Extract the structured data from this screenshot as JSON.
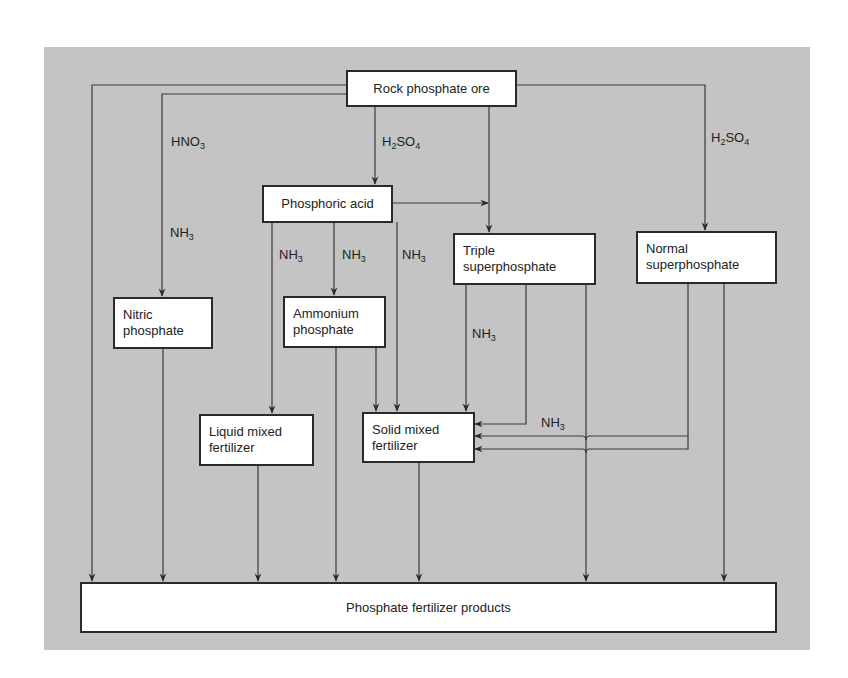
{
  "diagram": {
    "type": "flowchart",
    "colors": {
      "background": "#c4c4c4",
      "box_fill": "#ffffff",
      "line": "#2a2a2a"
    },
    "nodes": {
      "rock": {
        "line1": "Rock phosphate ore"
      },
      "phosphoric": {
        "line1": "Phosphoric acid"
      },
      "triple": {
        "line1": "Triple",
        "line2": "superphosphate"
      },
      "normal": {
        "line1": "Normal",
        "line2": "superphosphate"
      },
      "nitric": {
        "line1": "Nitric",
        "line2": "phosphate"
      },
      "ammonium": {
        "line1": "Ammonium",
        "line2": "phosphate"
      },
      "liquid": {
        "line1": "Liquid mixed",
        "line2": "fertilizer"
      },
      "solid": {
        "line1": "Solid mixed",
        "line2": "fertilizer"
      },
      "products": {
        "line1": "Phosphate fertilizer products"
      }
    },
    "edge_labels": {
      "hno3": {
        "base": "HNO",
        "sub": "3"
      },
      "h2so4_center": {
        "a": "H",
        "sub1": "2",
        "b": "SO",
        "sub2": "4"
      },
      "h2so4_right": {
        "a": "H",
        "sub1": "2",
        "b": "SO",
        "sub2": "4"
      },
      "nh3_nitric": {
        "base": "NH",
        "sub": "3"
      },
      "nh3_liquid": {
        "base": "NH",
        "sub": "3"
      },
      "nh3_ammonium": {
        "base": "NH",
        "sub": "3"
      },
      "nh3_solid": {
        "base": "NH",
        "sub": "3"
      },
      "nh3_triple": {
        "base": "NH",
        "sub": "3"
      },
      "nh3_normal": {
        "base": "NH",
        "sub": "3"
      }
    },
    "edges": [
      {
        "from": "Rock phosphate ore",
        "to": "Phosphate fertilizer products"
      },
      {
        "from": "Rock phosphate ore",
        "to": "Nitric phosphate",
        "reagents": [
          "HNO3",
          "NH3"
        ]
      },
      {
        "from": "Rock phosphate ore",
        "to": "Phosphoric acid",
        "reagent": "H2SO4"
      },
      {
        "from": "Rock phosphate ore",
        "to": "Triple superphosphate"
      },
      {
        "from": "Rock phosphate ore",
        "to": "Normal superphosphate",
        "reagent": "H2SO4"
      },
      {
        "from": "Phosphoric acid",
        "to": "Triple superphosphate"
      },
      {
        "from": "Phosphoric acid",
        "to": "Liquid mixed fertilizer",
        "reagent": "NH3"
      },
      {
        "from": "Phosphoric acid",
        "to": "Ammonium phosphate",
        "reagent": "NH3"
      },
      {
        "from": "Phosphoric acid",
        "to": "Solid mixed fertilizer",
        "reagent": "NH3"
      },
      {
        "from": "Nitric phosphate",
        "to": "Phosphate fertilizer products"
      },
      {
        "from": "Ammonium phosphate",
        "to": "Phosphate fertilizer products"
      },
      {
        "from": "Ammonium phosphate",
        "to": "Solid mixed fertilizer"
      },
      {
        "from": "Triple superphosphate",
        "to": "Solid mixed fertilizer",
        "reagent": "NH3"
      },
      {
        "from": "Triple superphosphate",
        "to": "Solid mixed fertilizer"
      },
      {
        "from": "Triple superphosphate",
        "to": "Phosphate fertilizer products"
      },
      {
        "from": "Normal superphosphate",
        "to": "Solid mixed fertilizer",
        "reagent": "NH3"
      },
      {
        "from": "Normal superphosphate",
        "to": "Solid mixed fertilizer"
      },
      {
        "from": "Normal superphosphate",
        "to": "Phosphate fertilizer products"
      },
      {
        "from": "Liquid mixed fertilizer",
        "to": "Phosphate fertilizer products"
      },
      {
        "from": "Solid mixed fertilizer",
        "to": "Phosphate fertilizer products"
      }
    ]
  }
}
